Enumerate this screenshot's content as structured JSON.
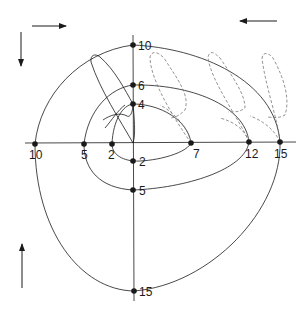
{
  "diagram": {
    "colors": {
      "ink": "#1a1a1a",
      "dashed": "#777777",
      "background": "#ffffff"
    },
    "horizontal_axis_labels": {
      "left_10": "10",
      "left_5": "5",
      "left_2": "2",
      "right_7": "7",
      "right_12": "12",
      "right_15": "15"
    },
    "vertical_axis_labels": {
      "top_10": "10",
      "top_6": "6",
      "top_4": "4",
      "bottom_2": "2",
      "bottom_5": "5",
      "bottom_15": "15"
    },
    "arrows": [
      {
        "position": "top-left-horizontal",
        "direction": "right"
      },
      {
        "position": "top-left-vertical",
        "direction": "down"
      },
      {
        "position": "top-right",
        "direction": "left"
      },
      {
        "position": "bottom-left",
        "direction": "up"
      }
    ]
  }
}
